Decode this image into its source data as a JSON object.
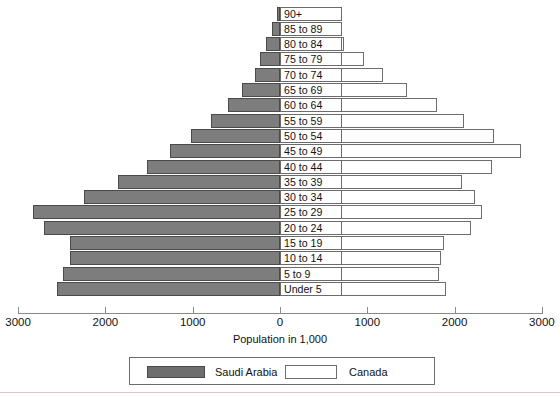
{
  "chart_data": {
    "type": "bar",
    "subtype": "population-pyramid",
    "title": "",
    "xlabel": "Population in 1,000",
    "ylabel": "",
    "xlim": [
      -3000,
      3000
    ],
    "xticks": [
      3000,
      2000,
      1000,
      0,
      1000,
      2000,
      3000
    ],
    "xtick_labels": [
      "3000",
      "2000",
      "1000",
      "0",
      "1000",
      "2000",
      "3000"
    ],
    "grid": false,
    "legend_position": "bottom-center",
    "categories": [
      "90+",
      "85 to 89",
      "80 to 84",
      "75 to 79",
      "70 to 74",
      "65 to 69",
      "60 to 64",
      "55 to 59",
      "50 to 54",
      "45 to 49",
      "40 to 44",
      "35 to 39",
      "30 to 34",
      "25 to 29",
      "20 to 24",
      "15 to 19",
      "10 to 14",
      "5 to 9",
      "Under 5"
    ],
    "series": [
      {
        "name": "Saudi Arabia",
        "side": "left",
        "color": "#7d7d7d",
        "values": [
          35,
          95,
          160,
          225,
          290,
          430,
          600,
          790,
          1020,
          1260,
          1520,
          1850,
          2250,
          2830,
          2700,
          2400,
          2400,
          2480,
          2550
        ]
      },
      {
        "name": "Canada",
        "side": "right",
        "color": "#ffffff",
        "values": [
          290,
          460,
          730,
          960,
          1180,
          1450,
          1800,
          2110,
          2450,
          2760,
          2430,
          2090,
          2230,
          2310,
          2190,
          1880,
          1840,
          1820,
          1900
        ]
      }
    ]
  },
  "legend": {
    "items": [
      {
        "label": "Saudi Arabia",
        "swatch": "filled-gray"
      },
      {
        "label": "Canada",
        "swatch": "outlined-white"
      }
    ]
  },
  "axis": {
    "title": "Population in 1,000"
  },
  "colors": {
    "saudi_fill": "#7d7d7d",
    "saudi_border": "#4a4a4a",
    "canada_fill": "#ffffff",
    "canada_border": "#6e6e6e",
    "axis": "#8a8a8a",
    "text": "#111111",
    "background": "#ffffff"
  }
}
